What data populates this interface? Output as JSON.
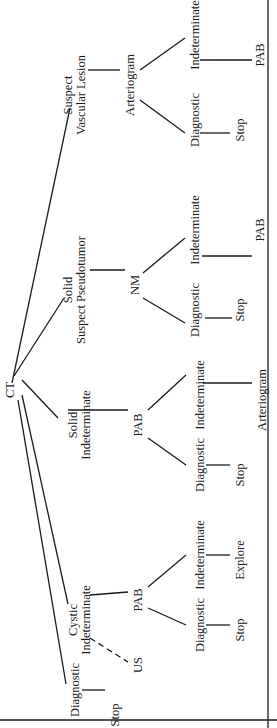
{
  "diagram": {
    "root": "CT",
    "nodes": [
      {
        "id": "ct",
        "label": "CT",
        "u": 338,
        "v": 10
      },
      {
        "id": "svl",
        "label": "Suspect\nVascular Lesion",
        "u": 633,
        "v": 75
      },
      {
        "id": "svl_art",
        "label": "Arteriogram",
        "u": 643,
        "v": 130
      },
      {
        "id": "svl_diag",
        "label": "Diagnostic",
        "u": 608,
        "v": 195
      },
      {
        "id": "svl_stop",
        "label": "Stop",
        "u": 598,
        "v": 240
      },
      {
        "id": "svl_ind",
        "label": "Indeterminate",
        "u": 693,
        "v": 195
      },
      {
        "id": "svl_pab",
        "label": "PAB",
        "u": 673,
        "v": 260
      },
      {
        "id": "ssp",
        "label": "Solid\nSuspect Pseudotumor",
        "u": 438,
        "v": 75
      },
      {
        "id": "ssp_nm",
        "label": "NM",
        "u": 443,
        "v": 135
      },
      {
        "id": "ssp_diag",
        "label": "Diagnostic",
        "u": 418,
        "v": 195
      },
      {
        "id": "ssp_stop",
        "label": "Stop",
        "u": 418,
        "v": 240
      },
      {
        "id": "ssp_ind",
        "label": "Indeterminate",
        "u": 498,
        "v": 195
      },
      {
        "id": "ssp_pab",
        "label": "PAB",
        "u": 498,
        "v": 260
      },
      {
        "id": "si",
        "label": "Solid\nIndeterminate",
        "u": 303,
        "v": 80
      },
      {
        "id": "si_pab",
        "label": "PAB",
        "u": 303,
        "v": 138
      },
      {
        "id": "si_diag",
        "label": "Diagnostic",
        "u": 263,
        "v": 200
      },
      {
        "id": "si_stop",
        "label": "Stop",
        "u": 253,
        "v": 240
      },
      {
        "id": "si_ind",
        "label": "Indeterminate",
        "u": 333,
        "v": 200
      },
      {
        "id": "si_art",
        "label": "Arteriogram",
        "u": 328,
        "v": 262
      },
      {
        "id": "ci",
        "label": "Cystic\nIndeterminate",
        "u": 108,
        "v": 80
      },
      {
        "id": "ci_pab",
        "label": "PAB",
        "u": 128,
        "v": 138
      },
      {
        "id": "ci_diag",
        "label": "Diagnostic",
        "u": 103,
        "v": 200
      },
      {
        "id": "ci_stop",
        "label": "Stop",
        "u": 98,
        "v": 240
      },
      {
        "id": "ci_ind",
        "label": "Indeterminate",
        "u": 173,
        "v": 200
      },
      {
        "id": "ci_explore",
        "label": "Explore",
        "u": 168,
        "v": 240
      },
      {
        "id": "ci_us",
        "label": "US",
        "u": 63,
        "v": 138
      },
      {
        "id": "diag",
        "label": "Diagnostic",
        "u": 38,
        "v": 75
      },
      {
        "id": "diag_stop",
        "label": "Stop",
        "u": 13,
        "v": 115
      }
    ],
    "edges": [
      {
        "from": [
          345,
          12
        ],
        "to": [
          620,
          70
        ]
      },
      {
        "from": [
          352,
          14
        ],
        "to": [
          430,
          64
        ]
      },
      {
        "from": [
          348,
          22
        ],
        "to": [
          310,
          58
        ]
      },
      {
        "from": [
          333,
          22
        ],
        "to": [
          124,
          68
        ]
      },
      {
        "from": [
          328,
          18
        ],
        "to": [
          44,
          66
        ]
      },
      {
        "from": [
          658,
          88
        ],
        "to": [
          658,
          120
        ]
      },
      {
        "from": [
          628,
          140
        ],
        "to": [
          595,
          185
        ]
      },
      {
        "from": [
          658,
          140
        ],
        "to": [
          690,
          185
        ]
      },
      {
        "from": [
          595,
          200
        ],
        "to": [
          595,
          230
        ]
      },
      {
        "from": [
          668,
          200
        ],
        "to": [
          668,
          252
        ]
      },
      {
        "from": [
          458,
          90
        ],
        "to": [
          458,
          125
        ]
      },
      {
        "from": [
          430,
          143
        ],
        "to": [
          405,
          185
        ]
      },
      {
        "from": [
          455,
          143
        ],
        "to": [
          490,
          185
        ]
      },
      {
        "from": [
          410,
          205
        ],
        "to": [
          410,
          232
        ]
      },
      {
        "from": [
          472,
          202
        ],
        "to": [
          472,
          252
        ]
      },
      {
        "from": [
          318,
          68
        ],
        "to": [
          318,
          128
        ]
      },
      {
        "from": [
          290,
          148
        ],
        "to": [
          263,
          186
        ]
      },
      {
        "from": [
          318,
          148
        ],
        "to": [
          353,
          186
        ]
      },
      {
        "from": [
          263,
          206
        ],
        "to": [
          263,
          230
        ]
      },
      {
        "from": [
          345,
          203
        ],
        "to": [
          345,
          252
        ]
      },
      {
        "from": [
          133,
          90
        ],
        "to": [
          136,
          128
        ]
      },
      {
        "from": [
          120,
          148
        ],
        "to": [
          103,
          186
        ]
      },
      {
        "from": [
          141,
          148
        ],
        "to": [
          173,
          186
        ]
      },
      {
        "from": [
          103,
          206
        ],
        "to": [
          103,
          230
        ]
      },
      {
        "from": [
          173,
          206
        ],
        "to": [
          173,
          230
        ]
      },
      {
        "from": [
          38,
          82
        ],
        "to": [
          38,
          105
        ]
      }
    ],
    "dashed_edges": [
      {
        "from": [
          90,
          90
        ],
        "to": [
          66,
          128
        ]
      }
    ],
    "frame_lines": [
      {
        "from": [
          8,
          0
        ],
        "to": [
          8,
          277
        ]
      },
      {
        "from": [
          0,
          268
        ],
        "to": [
          728,
          268
        ]
      }
    ]
  }
}
